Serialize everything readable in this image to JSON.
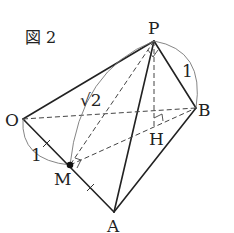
{
  "figure": {
    "title": "図 2",
    "points": {
      "P": {
        "label": "P",
        "x": 154,
        "y": 41
      },
      "O": {
        "label": "O",
        "x": 23,
        "y": 119
      },
      "B": {
        "label": "B",
        "x": 196,
        "y": 108
      },
      "M": {
        "label": "M",
        "x": 70,
        "y": 165
      },
      "A": {
        "label": "A",
        "x": 114,
        "y": 212
      },
      "H": {
        "label": "H",
        "x": 154,
        "y": 119
      }
    },
    "measurements": {
      "PB": "1",
      "OM": "1",
      "PM": "√2"
    },
    "colors": {
      "line": "#222222",
      "arc": "#777777",
      "background": "#ffffff"
    }
  }
}
